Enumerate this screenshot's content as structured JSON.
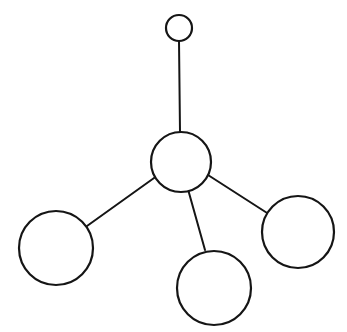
{
  "diagram": {
    "type": "tree",
    "colors": {
      "stroke": "#151515",
      "background": "#ffffff"
    },
    "nodes": [
      {
        "id": "top",
        "cx": 179,
        "cy": 28,
        "r": 13
      },
      {
        "id": "center",
        "cx": 181,
        "cy": 162,
        "r": 30
      },
      {
        "id": "left",
        "cx": 56,
        "cy": 248,
        "r": 37
      },
      {
        "id": "bottom",
        "cx": 214,
        "cy": 288,
        "r": 37
      },
      {
        "id": "right",
        "cx": 298,
        "cy": 232,
        "r": 36
      }
    ],
    "edges": [
      {
        "from": "top",
        "to": "center",
        "x1": 179,
        "y1": 41,
        "x2": 180,
        "y2": 132
      },
      {
        "from": "center",
        "to": "left",
        "x1": 168,
        "y1": 168,
        "x2": 87,
        "y2": 226
      },
      {
        "from": "center",
        "to": "bottom",
        "x1": 184,
        "y1": 175,
        "x2": 205,
        "y2": 250
      },
      {
        "from": "center",
        "to": "right",
        "x1": 208,
        "y1": 175,
        "x2": 278,
        "y2": 220
      }
    ]
  }
}
